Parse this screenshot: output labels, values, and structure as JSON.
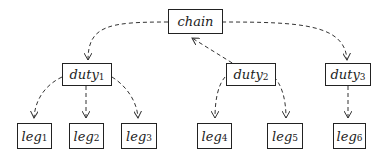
{
  "diagram": {
    "type": "tree",
    "edge_style": "dashed-arrow",
    "nodes": [
      {
        "id": "chain",
        "label": "chain",
        "sub": ""
      },
      {
        "id": "duty1",
        "label": "duty",
        "sub": "1"
      },
      {
        "id": "duty2",
        "label": "duty",
        "sub": "2"
      },
      {
        "id": "duty3",
        "label": "duty",
        "sub": "3"
      },
      {
        "id": "leg1",
        "label": "leg",
        "sub": "1"
      },
      {
        "id": "leg2",
        "label": "leg",
        "sub": "2"
      },
      {
        "id": "leg3",
        "label": "leg",
        "sub": "3"
      },
      {
        "id": "leg4",
        "label": "leg",
        "sub": "4"
      },
      {
        "id": "leg5",
        "label": "leg",
        "sub": "5"
      },
      {
        "id": "leg6",
        "label": "leg",
        "sub": "6"
      }
    ],
    "edges": [
      {
        "from": "chain",
        "to": "duty1"
      },
      {
        "from": "duty2",
        "to": "chain"
      },
      {
        "from": "chain",
        "to": "duty3"
      },
      {
        "from": "duty1",
        "to": "leg1"
      },
      {
        "from": "duty1",
        "to": "leg2"
      },
      {
        "from": "duty1",
        "to": "leg3"
      },
      {
        "from": "duty2",
        "to": "leg4"
      },
      {
        "from": "duty2",
        "to": "leg5"
      },
      {
        "from": "duty3",
        "to": "leg6"
      }
    ]
  }
}
